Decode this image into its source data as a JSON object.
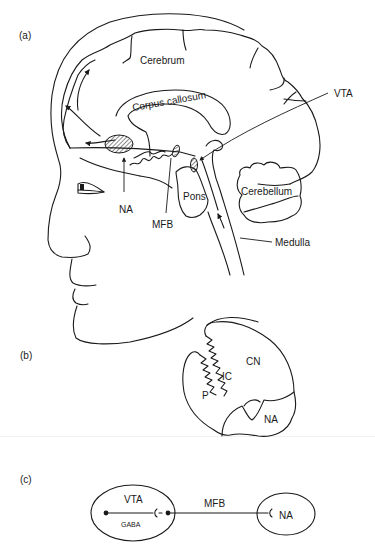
{
  "figure": {
    "panels": [
      {
        "id": "a",
        "label": "(a)",
        "description": "Sagittal section of human head showing brain reward pathway",
        "structures": {
          "cerebrum": "Cerebrum",
          "corpus_callosum": "Corpus callosum",
          "vta": "VTA",
          "na": "NA",
          "mfb": "MFB",
          "pons": "Pons",
          "cerebellum": "Cerebellum",
          "medulla": "Medulla"
        }
      },
      {
        "id": "b",
        "label": "(b)",
        "description": "Cross-section of striatum",
        "structures": {
          "cn": "CN",
          "ic": "IC",
          "p": "P",
          "na": "NA"
        }
      },
      {
        "id": "c",
        "label": "(c)",
        "description": "Schematic of VTA to NA projection via MFB with GABA interneuron",
        "structures": {
          "vta": "VTA",
          "gaba": "GABA",
          "mfb": "MFB",
          "na": "NA"
        }
      }
    ],
    "colors": {
      "line": "#1a1a1a",
      "background": "#ffffff"
    }
  }
}
